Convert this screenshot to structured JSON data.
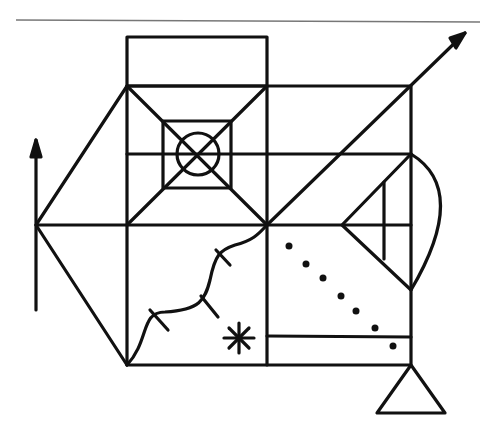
{
  "figure": {
    "stroke_color": "#111111",
    "rule_color": "#777777",
    "dot_count": 7,
    "elements": [
      "top-rule",
      "upper-rectangle",
      "main-rectangle",
      "left-triangle",
      "vertical-arrow",
      "diagonal-arrow",
      "inner-square",
      "circle-cross",
      "wavy-line",
      "asterisk",
      "dotted-diagonal",
      "right-semicircle",
      "small-right-triangle",
      "bottom-triangle",
      "lower-bar"
    ]
  }
}
